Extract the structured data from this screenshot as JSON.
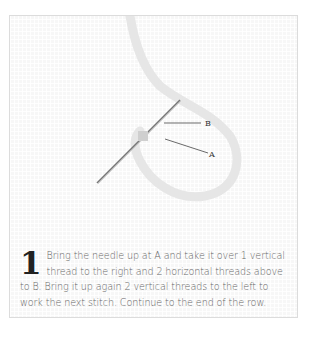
{
  "illustration": {
    "labels": {
      "a": "A",
      "b": "B"
    }
  },
  "caption": {
    "step_number": "1",
    "text": "Bring the needle up at A and take it over 1 vertical thread to the right and 2 horizontal threads above to B. Bring it up again 2 vertical threads to the left to work the next stitch. Continue to the end of the row."
  }
}
